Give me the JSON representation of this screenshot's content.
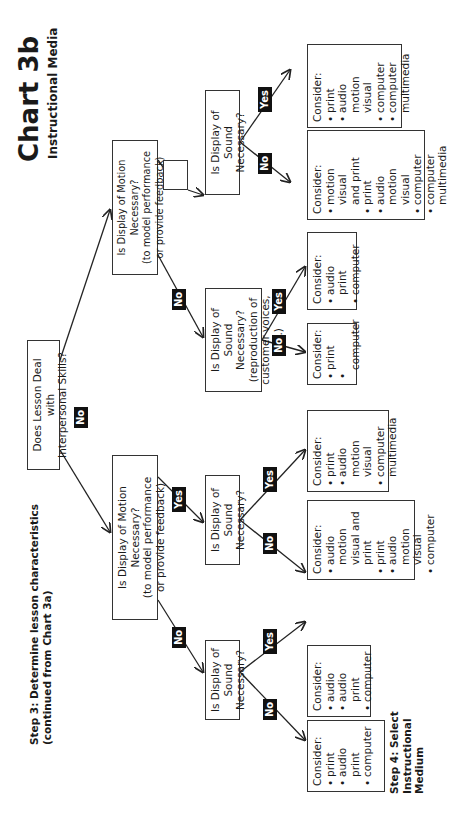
{
  "header": {
    "title": "Chart 3b",
    "subtitle": "Instructional Media",
    "step3_line1": "Step 3: Determine lesson characteristics",
    "step3_line2": "(continued from Chart 3a)",
    "step4_line1": "Step 4: Select",
    "step4_line2": "Instructional",
    "step4_line3": "Medium"
  },
  "root": {
    "line1": "Does Lesson Deal with",
    "line2": "Interpersonal Skills?"
  },
  "labels": {
    "yes": "Yes",
    "no": "No"
  },
  "motion_left": {
    "line1": "Is  Display of Motion Necessary?",
    "line2": "(to model performance",
    "line3": "or provide feedback)"
  },
  "motion_right": {
    "line1": "Is  Display of Motion Necessary?",
    "line2": "(to model performance",
    "line3": "or provide feedback)"
  },
  "sound_ll": {
    "line1": "Is  Display of",
    "line2": "Sound Necessary?"
  },
  "sound_lr": {
    "line1": "Is  Display of",
    "line2": "Sound Necessary?"
  },
  "sound_rl": {
    "line1": "Is Display of",
    "line2": "Sound Necessary?",
    "line3": "(reproduction of",
    "line4": "customer voices, etc.)"
  },
  "sound_rr": {
    "line1": "Is  Display of",
    "line2": "Sound Necessary?"
  },
  "results": {
    "r1": {
      "title": "Consider:",
      "items": [
        "print",
        "audio",
        "print",
        "computer"
      ],
      "bullets": [
        true,
        true,
        false,
        true
      ]
    },
    "r2": {
      "title": "Consider:",
      "items": [
        "audio",
        "audio print",
        "computer"
      ]
    },
    "r3": {
      "title": "Consider:",
      "items": [
        "audio motion",
        "visual and",
        "print",
        "print",
        "audio motion",
        "visual",
        "computer"
      ]
    },
    "r4": {
      "title": "Consider:",
      "items": [
        "print",
        "audio motion",
        "visual",
        "computer",
        "multimedia"
      ]
    },
    "r5": {
      "title": "Consider:",
      "items": [
        "print",
        "computer"
      ]
    },
    "r6": {
      "title": "Consider:",
      "items": [
        "audio print",
        "computer"
      ]
    },
    "r7": {
      "title": "Consider:",
      "items": [
        "motion visual",
        "and print",
        "print",
        "audio",
        "motion visual",
        "computer",
        "computer",
        "multimedia"
      ]
    },
    "r8": {
      "title": "Consider:",
      "items": [
        "print",
        "audio",
        "motion visual",
        "computer",
        "computer",
        "multimedia"
      ]
    }
  }
}
